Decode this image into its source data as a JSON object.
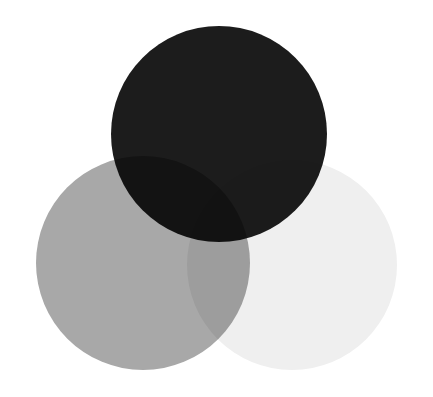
{
  "diagram": {
    "type": "venn",
    "background": "#ffffff",
    "circles": [
      {
        "id": "left",
        "cx": 143,
        "cy": 263,
        "r": 107,
        "color": "#a8a8a8",
        "label": ""
      },
      {
        "id": "right",
        "cx": 292,
        "cy": 265,
        "r": 105,
        "color": "#efefef",
        "label": ""
      },
      {
        "id": "top",
        "cx": 219,
        "cy": 134,
        "r": 108,
        "color": "#1c1c1c",
        "label": ""
      }
    ],
    "overlaps": {
      "top_left": "#000000",
      "left_right": "#8a8a8a",
      "top_right": "#1a1a1a"
    }
  }
}
